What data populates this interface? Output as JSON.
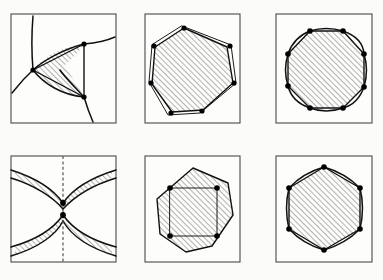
{
  "figure": {
    "background_color": "#fbfbfa",
    "frame_color": "#4a4a4a",
    "ink_color": "#111111",
    "hatch_color": "#555555",
    "hatch_angle_deg": 45,
    "hatch_spacing_px": 4,
    "vertex_dot_color": "#000000",
    "grid": {
      "columns": 3,
      "rows": 2,
      "panel_count": 6
    },
    "canvas": {
      "width": 383,
      "height": 280
    }
  },
  "panels": [
    {
      "id": "panel-1",
      "name": "ideal-triangle",
      "label": "",
      "row": 1,
      "column": 1,
      "frame": {
        "x": 11,
        "y": 14,
        "width": 105,
        "height": 109
      },
      "shape_type": "curved-triangle",
      "vertex_count": 3,
      "has_dashed_axis": false,
      "vertices": [
        {
          "x": 33,
          "y": 70
        },
        {
          "x": 84,
          "y": 44
        },
        {
          "x": 84,
          "y": 97
        }
      ],
      "arc_bulge": "outward",
      "description": "Hyperbolic triangle with three ideal-looking curved sides and an inscribed straight triangle"
    },
    {
      "id": "panel-2",
      "name": "heptagon-pair",
      "label": "",
      "row": 1,
      "column": 2,
      "frame": {
        "x": 145,
        "y": 14,
        "width": 95,
        "height": 109
      },
      "shape_type": "overlapping-polygons",
      "vertex_count": 7,
      "has_dashed_axis": false,
      "vertices": [
        {
          "x": 184,
          "y": 28
        },
        {
          "x": 227,
          "y": 47
        },
        {
          "x": 233,
          "y": 83
        },
        {
          "x": 203,
          "y": 110
        },
        {
          "x": 172,
          "y": 112
        },
        {
          "x": 152,
          "y": 84
        },
        {
          "x": 155,
          "y": 47
        }
      ],
      "arc_bulge": "slight-outward",
      "description": "Two nearly coincident heptagons, one rotated slightly relative to the other"
    },
    {
      "id": "panel-3",
      "name": "octagon-curved",
      "label": "",
      "row": 1,
      "column": 3,
      "frame": {
        "x": 276,
        "y": 14,
        "width": 96,
        "height": 109
      },
      "shape_type": "curved-octagon",
      "vertex_count": 8,
      "has_dashed_axis": false,
      "vertices": [
        {
          "x": 310,
          "y": 31
        },
        {
          "x": 343,
          "y": 31
        },
        {
          "x": 364,
          "y": 54
        },
        {
          "x": 364,
          "y": 87
        },
        {
          "x": 343,
          "y": 108
        },
        {
          "x": 310,
          "y": 108
        },
        {
          "x": 288,
          "y": 86
        },
        {
          "x": 288,
          "y": 54
        }
      ],
      "arc_bulge": "outward",
      "description": "Regular octagon with outward bulging circular arcs and straight inner chords"
    },
    {
      "id": "panel-4",
      "name": "degenerate-bigon",
      "label": "",
      "row": 2,
      "column": 1,
      "frame": {
        "x": 11,
        "y": 156,
        "width": 105,
        "height": 106
      },
      "shape_type": "pinched-bigon",
      "vertex_count": 2,
      "has_dashed_axis": true,
      "dashed_axis": {
        "x": 63,
        "y1": 156,
        "y2": 262,
        "orientation": "vertical"
      },
      "vertices": [
        {
          "x": 63,
          "y": 203
        },
        {
          "x": 63,
          "y": 215
        }
      ],
      "arc_bulge": "hourglass",
      "description": "Degenerate two-vertex region pinched on a vertical dashed symmetry axis"
    },
    {
      "id": "panel-5",
      "name": "square-in-octagon",
      "label": "",
      "row": 2,
      "column": 2,
      "frame": {
        "x": 145,
        "y": 156,
        "width": 95,
        "height": 106
      },
      "shape_type": "square-and-octagon",
      "vertex_count": 4,
      "has_dashed_axis": false,
      "vertices": [
        {
          "x": 170,
          "y": 188
        },
        {
          "x": 217,
          "y": 188
        },
        {
          "x": 217,
          "y": 236
        },
        {
          "x": 170,
          "y": 236
        }
      ],
      "arc_bulge": "none",
      "description": "Axis-aligned square with four marked corners inscribed in a larger rotated octagon"
    },
    {
      "id": "panel-6",
      "name": "hexagon-curved",
      "label": "",
      "row": 2,
      "column": 3,
      "frame": {
        "x": 276,
        "y": 156,
        "width": 96,
        "height": 106
      },
      "shape_type": "curved-hexagon",
      "vertex_count": 6,
      "has_dashed_axis": false,
      "vertices": [
        {
          "x": 324,
          "y": 167
        },
        {
          "x": 360,
          "y": 188
        },
        {
          "x": 360,
          "y": 229
        },
        {
          "x": 324,
          "y": 250
        },
        {
          "x": 289,
          "y": 229
        },
        {
          "x": 289,
          "y": 188
        }
      ],
      "arc_bulge": "slight-outward",
      "description": "Hexagon with slightly outward curving sides and straight chords inside the hatched area"
    }
  ]
}
